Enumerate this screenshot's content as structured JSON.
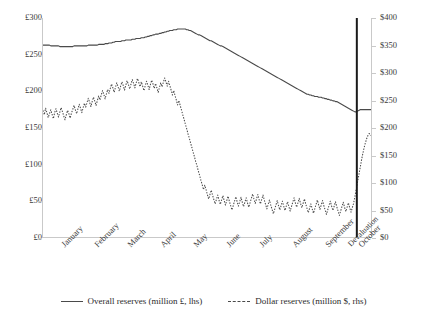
{
  "chart_data": {
    "type": "line",
    "title": "",
    "subtitle": "",
    "xlabel": "",
    "ylabel": "",
    "grid": false,
    "legend_position": "bottom",
    "x_tick_labels": [
      "January",
      "February",
      "March",
      "April",
      "May",
      "June",
      "July",
      "August",
      "September",
      "October"
    ],
    "annotations": [
      {
        "label": "Devaluation",
        "type": "vertical-line",
        "x_fraction": 0.951
      }
    ],
    "axes": {
      "left": {
        "label": "Overall reserves (million £, lhs)",
        "currency": "£",
        "ylim": [
          0,
          300
        ],
        "tick_step": 50,
        "tick_labels": [
          "£0",
          "£50",
          "£100",
          "£150",
          "£200",
          "£250",
          "£300"
        ]
      },
      "right": {
        "label": "Dollar reserves (million $, rhs)",
        "currency": "$",
        "ylim": [
          0,
          400
        ],
        "tick_step": 50,
        "tick_labels": [
          "$0",
          "$50",
          "$100",
          "$150",
          "$200",
          "$250",
          "$300",
          "$350",
          "$400"
        ]
      }
    },
    "series": [
      {
        "name": "Overall reserves (million £, lhs)",
        "axis": "left",
        "style": "solid",
        "color": "#4a4a4a",
        "values": [
          263,
          263,
          263,
          263,
          263,
          263,
          262,
          262,
          262,
          262,
          262,
          262,
          262,
          261,
          261,
          261,
          261,
          261,
          261,
          261,
          261,
          261,
          261,
          261,
          262,
          262,
          262,
          262,
          262,
          262,
          262,
          262,
          262,
          262,
          262,
          263,
          263,
          263,
          263,
          263,
          263,
          263,
          263,
          264,
          264,
          264,
          264,
          264,
          265,
          265,
          265,
          266,
          266,
          266,
          267,
          267,
          268,
          268,
          268,
          268,
          268,
          269,
          269,
          269,
          270,
          270,
          270,
          270,
          270,
          271,
          271,
          271,
          272,
          272,
          272,
          272,
          273,
          273,
          273,
          274,
          274,
          275,
          275,
          276,
          276,
          277,
          277,
          278,
          278,
          278,
          279,
          279,
          280,
          280,
          281,
          281,
          282,
          282,
          283,
          283,
          283,
          284,
          284,
          284,
          285,
          285,
          285,
          285,
          285,
          285,
          285,
          284,
          284,
          283,
          283,
          282,
          281,
          280,
          279,
          278,
          277,
          277,
          276,
          275,
          274,
          273,
          272,
          271,
          270,
          269,
          269,
          268,
          267,
          266,
          265,
          264,
          263,
          262,
          262,
          261,
          260,
          259,
          258,
          257,
          256,
          255,
          254,
          253,
          252,
          251,
          250,
          249,
          248,
          247,
          246,
          245,
          244,
          243,
          242,
          241,
          240,
          239,
          238,
          237,
          236,
          235,
          234,
          233,
          232,
          231,
          230,
          229,
          228,
          227,
          226,
          225,
          224,
          223,
          222,
          221,
          220,
          219,
          218,
          217,
          216,
          215,
          214,
          213,
          212,
          211,
          210,
          209,
          208,
          207,
          206,
          205,
          204,
          203,
          202,
          201,
          200,
          199,
          198,
          197,
          196,
          196,
          195,
          195,
          194,
          194,
          193,
          193,
          193,
          192,
          192,
          192,
          191,
          191,
          190,
          190,
          189,
          189,
          188,
          188,
          187,
          187,
          186,
          186,
          185,
          184,
          183,
          182,
          181,
          180,
          179,
          178,
          177,
          176,
          175,
          174,
          173,
          172,
          172,
          173,
          174,
          175,
          175,
          175,
          175,
          175,
          175,
          175,
          175,
          175,
          175,
          175
        ]
      },
      {
        "name": "Dollar reserves (million $, rhs)",
        "axis": "right",
        "style": "dotted",
        "color": "#4a4a4a",
        "values": [
          232,
          224,
          236,
          228,
          219,
          226,
          233,
          225,
          217,
          228,
          235,
          227,
          220,
          229,
          237,
          230,
          222,
          215,
          224,
          232,
          226,
          218,
          227,
          234,
          241,
          233,
          226,
          235,
          243,
          236,
          228,
          237,
          245,
          238,
          246,
          254,
          247,
          239,
          248,
          256,
          249,
          241,
          250,
          258,
          251,
          260,
          268,
          261,
          253,
          262,
          270,
          263,
          272,
          280,
          273,
          265,
          274,
          282,
          275,
          267,
          276,
          284,
          277,
          269,
          278,
          286,
          279,
          271,
          280,
          288,
          281,
          273,
          282,
          290,
          283,
          275,
          284,
          276,
          268,
          277,
          285,
          278,
          270,
          279,
          287,
          280,
          272,
          281,
          273,
          265,
          274,
          282,
          275,
          283,
          291,
          284,
          276,
          285,
          277,
          269,
          260,
          268,
          259,
          251,
          242,
          250,
          241,
          233,
          224,
          216,
          207,
          199,
          190,
          182,
          173,
          165,
          156,
          148,
          139,
          131,
          122,
          114,
          105,
          97,
          88,
          96,
          88,
          79,
          71,
          79,
          87,
          78,
          70,
          62,
          70,
          78,
          69,
          61,
          69,
          77,
          68,
          60,
          68,
          76,
          67,
          59,
          51,
          59,
          67,
          75,
          66,
          58,
          66,
          74,
          65,
          57,
          65,
          73,
          64,
          56,
          64,
          72,
          80,
          71,
          63,
          71,
          79,
          70,
          62,
          70,
          78,
          69,
          61,
          53,
          61,
          69,
          60,
          52,
          44,
          52,
          60,
          68,
          59,
          51,
          59,
          67,
          58,
          50,
          58,
          66,
          57,
          49,
          57,
          65,
          73,
          64,
          56,
          64,
          72,
          63,
          55,
          63,
          71,
          62,
          54,
          46,
          54,
          62,
          53,
          45,
          53,
          61,
          69,
          60,
          52,
          60,
          68,
          59,
          51,
          43,
          51,
          59,
          67,
          58,
          50,
          58,
          66,
          57,
          49,
          41,
          49,
          57,
          65,
          56,
          48,
          56,
          64,
          55,
          47,
          55,
          63,
          75,
          88,
          101,
          114,
          127,
          140,
          152,
          163,
          172,
          180,
          186,
          190,
          188,
          185,
          187
        ]
      }
    ]
  },
  "legend": {
    "items": [
      {
        "label": "Overall reserves (million £, lhs)",
        "style": "solid"
      },
      {
        "label": "Dollar reserves (million $, rhs)",
        "style": "dotted"
      }
    ]
  },
  "colors": {
    "line": "#4a4a4a",
    "axis": "#c9c9c9",
    "text": "#3a3a3a",
    "background": "#ffffff",
    "annotation": "#1a1a1a"
  }
}
